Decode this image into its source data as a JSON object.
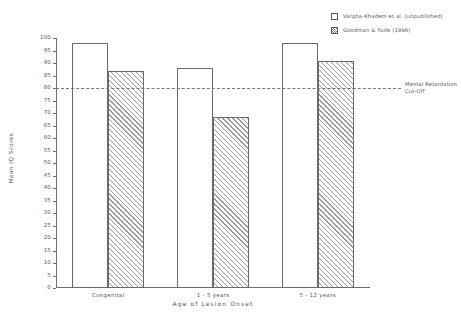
{
  "chart_data": {
    "type": "bar",
    "title": "",
    "xlabel": "Age of Lesion Onset",
    "ylabel": "Mean IQ Scores",
    "categories": [
      "Congenital",
      "1 - 5 years",
      "5 - 12 years"
    ],
    "series": [
      {
        "name": "Vargha-Khadem et al. (unpublished)",
        "fill": "open",
        "values": [
          98,
          88,
          98
        ]
      },
      {
        "name": "Goodman & Yude (1996)",
        "fill": "hatched",
        "values": [
          87,
          68.5,
          91
        ]
      }
    ],
    "ylim": [
      0,
      100
    ],
    "yticks": [
      0,
      5,
      10,
      15,
      20,
      25,
      30,
      35,
      40,
      45,
      50,
      55,
      60,
      65,
      70,
      75,
      80,
      85,
      90,
      95,
      100
    ],
    "grid": false,
    "legend_position": "top-right",
    "annotations": [
      {
        "name": "mental-retardation-cutoff",
        "value": 80,
        "line_style": "dashed",
        "label_line1": "Mental Retardation",
        "label_line2": "Cut-Off"
      }
    ]
  },
  "legend": {
    "items": [
      {
        "label": "Vargha-Khadem et al. (unpublished)",
        "swatch": "open-square-icon"
      },
      {
        "label": "Goodman & Yude (1996)",
        "swatch": "hatched-square-icon"
      }
    ]
  },
  "colors": {
    "axis": "#6f6f6f",
    "text": "#555555",
    "bar_outline": "#6a6a6a",
    "hatch": "#9a9a9a",
    "cutoff": "#777777",
    "background": "#ffffff"
  }
}
